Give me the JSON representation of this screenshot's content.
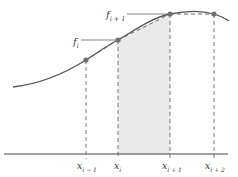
{
  "diagram": {
    "colors": {
      "curve": "#555555",
      "axis": "#444444",
      "point": "#707070",
      "shade": "#e9e9e9",
      "dashed": "#666666",
      "label": "#3a3a3a"
    },
    "nodes": [
      {
        "id": "x_im1",
        "base": "x",
        "sub": "i − 1",
        "px": 86,
        "py": 60
      },
      {
        "id": "x_i",
        "base": "x",
        "sub": "i",
        "px": 118,
        "py": 40
      },
      {
        "id": "x_ip1",
        "base": "x",
        "sub": "i + 1",
        "px": 170,
        "py": 14
      },
      {
        "id": "x_ip2",
        "base": "x",
        "sub": "i + 2",
        "px": 214,
        "py": 14
      }
    ],
    "function_labels": [
      {
        "id": "f_i",
        "base": "f",
        "sub": "i",
        "node": "x_i"
      },
      {
        "id": "f_ip1",
        "base": "f",
        "sub": "i + 1",
        "node": "x_ip1"
      }
    ],
    "shaded_region": {
      "from": "x_i",
      "to": "x_ip1",
      "description": "area under chord (trapezoid)"
    },
    "labels": {
      "x_im1_base": "x",
      "x_im1_sub": "i − 1",
      "x_i_base": "x",
      "x_i_sub": "i",
      "x_ip1_base": "x",
      "x_ip1_sub": "i + 1",
      "x_ip2_base": "x",
      "x_ip2_sub": "i + 2",
      "f_i_base": "f",
      "f_i_sub": "i",
      "f_ip1_base": "f",
      "f_ip1_sub": "i + 1"
    }
  }
}
